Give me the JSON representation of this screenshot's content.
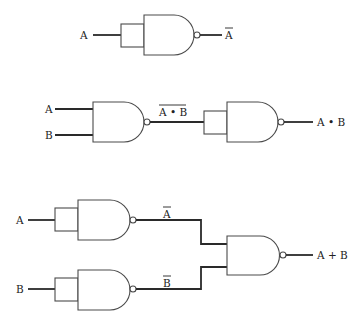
{
  "diagram": {
    "colors": {
      "line": "#2a2a2a",
      "outline": "#4a4a4a",
      "text": "#222222",
      "background": "#ffffff"
    },
    "circuits": [
      {
        "name": "not-from-nand",
        "inputs": [
          "A"
        ],
        "output_label": "A",
        "output_overline": true
      },
      {
        "name": "and-from-nand",
        "inputs": [
          "A",
          "B"
        ],
        "intermediate_label": "A • B",
        "intermediate_overline": true,
        "output_label": "A • B"
      },
      {
        "name": "or-from-nand",
        "inputs": [
          "A",
          "B"
        ],
        "intermediate_labels": [
          "A",
          "B"
        ],
        "intermediate_overline": true,
        "output_label": "A + B"
      }
    ]
  }
}
